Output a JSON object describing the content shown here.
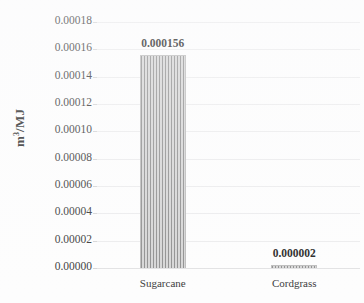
{
  "chart_data": {
    "type": "bar",
    "title": "",
    "subtitle": "",
    "xlabel": "",
    "ylabel": "m3/MJ",
    "ylabel_html": "m<sup>3</sup>/MJ",
    "categories": [
      "Sugarcane",
      "Cordgrass"
    ],
    "values": [
      0.000156,
      2e-06
    ],
    "data_labels": [
      "0.000156",
      "0.000002"
    ],
    "ylim": [
      0.0,
      0.00018
    ],
    "ytick_values": [
      0.00018,
      0.00016,
      0.00014,
      0.00012,
      0.0001,
      8e-05,
      6e-05,
      4e-05,
      2e-05,
      0.0
    ],
    "ytick_labels": [
      "0.00018",
      "0.00016",
      "0.00014",
      "0.00012",
      "0.00010",
      "0.00008",
      "0.00006",
      "0.00004",
      "0.00002",
      "0.00000"
    ],
    "grid": true,
    "grid_axis": "y",
    "legend": false,
    "legend_position": "none",
    "series": [
      {
        "name": "",
        "values": [
          0.000156,
          2e-06
        ],
        "fill": "vertical-hatch",
        "fill_color": "#d9d9d9",
        "hatch_color": "#909090"
      }
    ]
  },
  "style": {
    "background": "#fdfdfd",
    "text_color": "#3a3a3a",
    "label_color": "#262626",
    "gridline_color": "#ececed",
    "bar_border_color": "#bdbdbd"
  }
}
